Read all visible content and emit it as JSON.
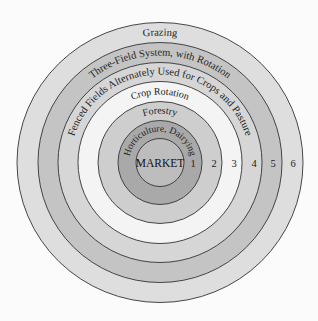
{
  "diagram": {
    "center_label": "MARKET",
    "colors": {
      "market": "#bdbdbd",
      "zone1": "#a9a9a9",
      "zone2": "#cecece",
      "zone3": "#f4f4f4",
      "zone4": "#d6d6d6",
      "zone5": "#c4c4c4",
      "zone6": "#dedede",
      "stroke": "#333333",
      "background": "#fbfbfb"
    },
    "zones": [
      {
        "number": "1",
        "label": "Horticulture, Dairying"
      },
      {
        "number": "2",
        "label": "Forestry"
      },
      {
        "number": "3",
        "label": "Crop Rotation"
      },
      {
        "number": "4",
        "label": "Fenced Fields Alternately Used for Crops and Pasture"
      },
      {
        "number": "5",
        "label": "Three-Field System, with Rotation"
      },
      {
        "number": "6",
        "label": "Grazing"
      }
    ]
  }
}
